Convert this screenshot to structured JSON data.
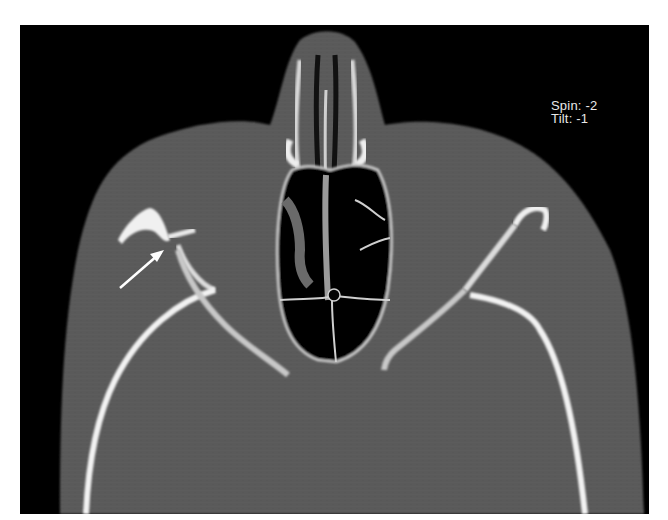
{
  "image": {
    "type": "axial CT scan, bone window",
    "colors": {
      "background": "#000000",
      "soft_tissue": "#595959",
      "bone": "#e6e6e6",
      "air": "#050505",
      "page": "#ffffff"
    }
  },
  "overlay": {
    "spin_label": "Spin:  -2",
    "tilt_label": "Tilt:  -1"
  },
  "annotation": {
    "arrow": {
      "color": "#ffffff",
      "from": [
        120,
        288
      ],
      "to": [
        162,
        252
      ]
    }
  }
}
